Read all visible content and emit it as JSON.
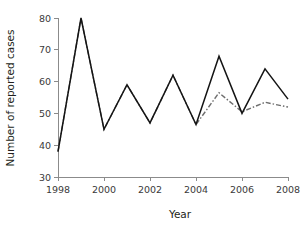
{
  "chart_data": {
    "type": "line",
    "title": "",
    "xlabel": "Year",
    "ylabel": "Number of reported cases",
    "xlim": [
      1998,
      2008
    ],
    "ylim": [
      30,
      80
    ],
    "grid": false,
    "legend": "none",
    "x": [
      1998,
      1999,
      2000,
      2001,
      2002,
      2003,
      2004,
      2005,
      2006,
      2007,
      2008
    ],
    "xticks": [
      1998,
      2000,
      2002,
      2004,
      2006,
      2008
    ],
    "xtick_labels": [
      "1998",
      "2000",
      "2002",
      "2004",
      "2006",
      "2008"
    ],
    "yticks": [
      30,
      40,
      50,
      60,
      70,
      80
    ],
    "ytick_labels": [
      "30",
      "40",
      "50",
      "60",
      "70",
      "80"
    ],
    "series": [
      {
        "name": "observed",
        "style": "solid",
        "color": "#141414",
        "x": [
          1998,
          1999,
          2000,
          2001,
          2002,
          2003,
          2004,
          2005,
          2006,
          2007,
          2008
        ],
        "values": [
          38,
          80,
          45,
          59,
          47,
          62,
          46.5,
          68,
          50,
          64,
          54.5
        ]
      },
      {
        "name": "fitted",
        "style": "dash-dot",
        "color": "#6e6e6e",
        "x": [
          1998,
          1999,
          2000,
          2001,
          2002,
          2003,
          2004,
          2005,
          2006,
          2007,
          2008
        ],
        "values": [
          38,
          80,
          45,
          59,
          47,
          62,
          46.5,
          56.5,
          50.5,
          53.5,
          52
        ]
      }
    ]
  },
  "axes": {
    "y_axis_label": "Number of reported cases",
    "x_axis_label": "Year"
  }
}
